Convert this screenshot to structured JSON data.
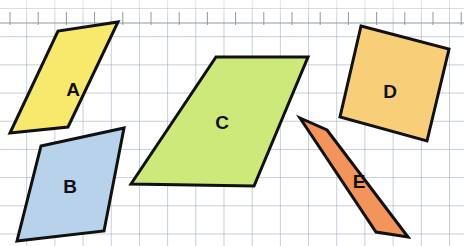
{
  "canvas": {
    "width": 464,
    "height": 246,
    "background_color": "#ffffff"
  },
  "grid": {
    "cell_size_px": 28,
    "line_color": "#96a5b9",
    "visible": true,
    "ruler_line_color": "#9aa4ad"
  },
  "clipped_text_top": {
    "left_fragment": "g",
    "middle_fragment": "o",
    "right_fragment": "g"
  },
  "figure": {
    "caption": "Five quadrilaterals labelled A to E drawn on square grid paper",
    "shape_count": 5,
    "outline_color": "#111111",
    "outline_width_px": 3
  },
  "shapes": [
    {
      "id": "A",
      "label": "A",
      "kind": "parallelogram",
      "fill_color": "#F7E96B",
      "stroke_color": "#111111",
      "points": "10,133 58,31 118,22 68,127",
      "label_x": 73,
      "label_y": 91,
      "label_size": 19
    },
    {
      "id": "B",
      "label": "B",
      "kind": "parallelogram",
      "fill_color": "#B8D2EB",
      "stroke_color": "#111111",
      "points": "41,146 124,128 104,231 17,241",
      "label_x": 70,
      "label_y": 188,
      "label_size": 19
    },
    {
      "id": "C",
      "label": "C",
      "kind": "parallelogram",
      "fill_color": "#CDE97A",
      "stroke_color": "#111111",
      "points": "216,57 308,57 254,186 131,184",
      "label_x": 222,
      "label_y": 124,
      "label_size": 19
    },
    {
      "id": "D",
      "label": "D",
      "kind": "square",
      "fill_color": "#F8CE79",
      "stroke_color": "#111111",
      "points": "361,26 449,49 427,141 340,117",
      "label_x": 390,
      "label_y": 93,
      "label_size": 19
    },
    {
      "id": "E",
      "label": "E",
      "kind": "parallelogram",
      "fill_color": "#F3955A",
      "stroke_color": "#111111",
      "points": "300,118 327,130 408,237 376,232",
      "label_x": 359,
      "label_y": 183,
      "label_size": 19
    }
  ],
  "ruler": {
    "baseline_y": 23,
    "tick_top_y": 12,
    "tick_spacing_px": 28.2,
    "tick_start_x": 10,
    "tick_count": 17,
    "color": "#8e99a6"
  }
}
